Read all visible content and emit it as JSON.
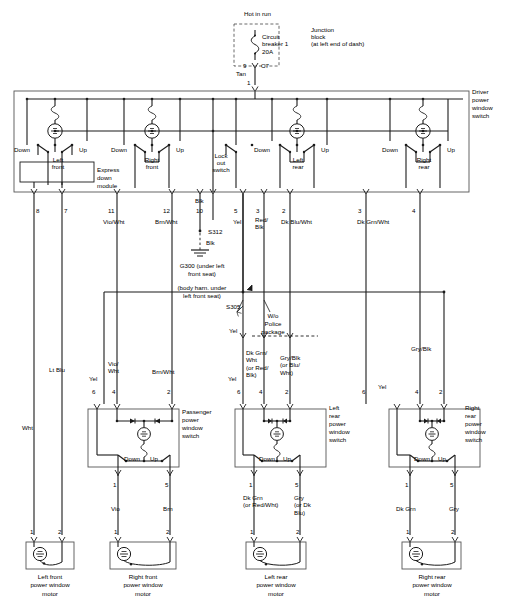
{
  "diagram": {
    "type": "automotive-wiring-schematic"
  },
  "power_source": {
    "hot_label": "Hot in run",
    "breaker_name": "Circuit\nbreaker 1",
    "breaker_rating": "20A",
    "junction_label": "Junction\nblock\n(at left end of dash)",
    "connector_pin": "9",
    "connector_name": "C7",
    "feed_wire_color": "Tan",
    "feed_pin": "1"
  },
  "driver_switch": {
    "label": "Driver\npower\nwindow\nswitch",
    "module_label": "Express\ndown\nmodule",
    "sections": [
      {
        "name": "Left\nfront",
        "down": "Down",
        "up": "Up"
      },
      {
        "name": "Right\nfront",
        "down": "Down",
        "up": "Up"
      },
      {
        "name": "Lock\nout\nswitch",
        "down": "",
        "up": ""
      },
      {
        "name": "Left\nrear",
        "down": "Down",
        "up": "Up"
      },
      {
        "name": "Right\nrear",
        "down": "Down",
        "up": "Up"
      }
    ]
  },
  "driver_pins": [
    {
      "num": "8",
      "color": "",
      "x": 61
    },
    {
      "num": "7",
      "color": "",
      "x": 95
    },
    {
      "num": "11",
      "color": "Vio/Wht",
      "x": 117
    },
    {
      "num": "12",
      "color": "Brn/Wht",
      "x": 172
    },
    {
      "num": "10",
      "color": "Blk",
      "x": 200
    },
    {
      "num": "5",
      "color": "Yel",
      "x": 243
    },
    {
      "num": "3",
      "color": "Red/\nBlk",
      "x": 264
    },
    {
      "num": "2",
      "color": "Dk Blu/Wht",
      "x": 290
    },
    {
      "num": "3",
      "color": "Dk Grn/Wht",
      "x": 366
    },
    {
      "num": "4",
      "color": "",
      "x": 420
    }
  ],
  "ground": {
    "splice_top": "S312",
    "wire_color_top": "Blk",
    "wire_color_bottom": "Blk",
    "ground_label": "G300 (under left\nfront seat)",
    "harness_note": "(body harn. under\nleft front seat)",
    "splice_bottom": "S305"
  },
  "police_note": {
    "label": "W/o\nPolice\npackage",
    "lead_color": "Yel"
  },
  "mid_wires": [
    {
      "color": "Wht",
      "x": 30,
      "y": 430
    },
    {
      "color": "Lt Blu",
      "x": 62,
      "y": 368
    },
    {
      "color": "Yel",
      "x": 97,
      "y": 368
    },
    {
      "color": "Vio/\nWht",
      "x": 117,
      "y": 362
    },
    {
      "color": "Brn/Wht",
      "x": 160,
      "y": 368
    },
    {
      "color": "Yel",
      "x": 228,
      "y": 347
    },
    {
      "color": "Dk Grn/\nWht\n(or Red/\nBlk)",
      "x": 247,
      "y": 350
    },
    {
      "color": "Gry/Blk\n(or Blu/\nWht)",
      "x": 296,
      "y": 354
    },
    {
      "color": "Gry/Blk",
      "x": 417,
      "y": 347
    },
    {
      "color": "Yel",
      "x": 380,
      "y": 383
    }
  ],
  "sub_switches": [
    {
      "label": "Passenger\npower\nwindow\nswitch",
      "down": "Down",
      "up": "Up",
      "top_pins": [
        "6",
        "4",
        "2"
      ],
      "bottom_pins": [
        "1",
        "5"
      ],
      "out_colors": [
        "Vio",
        "Brn"
      ]
    },
    {
      "label": "Left\nrear\npower\nwindow\nswitch",
      "down": "Down",
      "up": "Up",
      "top_pins": [
        "6",
        "4",
        "2"
      ],
      "bottom_pins": [
        "1",
        "5"
      ],
      "out_colors": [
        "Dk Grn\n(or Red/Wht)",
        "Gry\n(or Dk\nBlu)"
      ]
    },
    {
      "label": "Right\nrear\npower\nwindow\nswitch",
      "down": "Down",
      "up": "Up",
      "top_pins": [
        "6",
        "4",
        "2"
      ],
      "bottom_pins": [
        "1",
        "5"
      ],
      "out_colors": [
        "Dk Grn",
        "Gry"
      ]
    }
  ],
  "motors": [
    {
      "label": "Left front\npower window\nmotor",
      "pins": [
        "1",
        "2"
      ],
      "colors": [
        "Wht",
        "Lt Blu"
      ]
    },
    {
      "label": "Right front\npower window\nmotor",
      "pins": [
        "1",
        "2"
      ],
      "colors": [
        "Vio",
        "Brn"
      ]
    },
    {
      "label": "Left rear\npower window\nmotor",
      "pins": [
        "1",
        "2"
      ],
      "colors": [
        "Dk Grn\n(or Red/Wht)",
        "Gry\n(or Dk\nBlu)"
      ]
    },
    {
      "label": "Right rear\npower window\nmotor",
      "pins": [
        "1",
        "2"
      ],
      "colors": [
        "Dk Grn",
        "Gry"
      ]
    }
  ],
  "colors": {
    "line": "#1a1a1a",
    "box": "#555555",
    "background": "#ffffff"
  }
}
